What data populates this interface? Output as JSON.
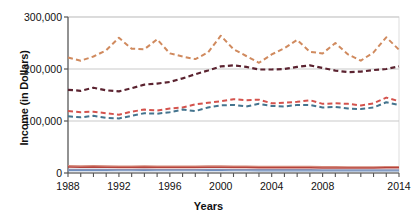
{
  "chart_data": {
    "type": "line",
    "title": "",
    "subtitle": "",
    "xlabel": "Years",
    "ylabel": "Income (in Dollars)",
    "xlim": [
      1988,
      2014
    ],
    "ylim": [
      0,
      300000
    ],
    "grid": true,
    "grid_axis": "y",
    "legend": "none",
    "y_ticks": [
      0,
      100000,
      200000,
      300000
    ],
    "y_tick_labels": [
      "0",
      "100,000",
      "200,000",
      "300,000"
    ],
    "x_ticks": [
      1988,
      1989,
      1990,
      1991,
      1992,
      1993,
      1994,
      1995,
      1996,
      1997,
      1998,
      1999,
      2000,
      2001,
      2002,
      2003,
      2004,
      2005,
      2006,
      2007,
      2008,
      2009,
      2010,
      2011,
      2012,
      2013,
      2014
    ],
    "x_tick_labels_shown": [
      "1988",
      "1992",
      "1996",
      "2000",
      "2004",
      "2008",
      "2014"
    ],
    "x_tick_labels_years": [
      1988,
      1992,
      1996,
      2000,
      2004,
      2008,
      2014
    ],
    "x": [
      1988,
      1989,
      1990,
      1991,
      1992,
      1993,
      1994,
      1995,
      1996,
      1997,
      1998,
      1999,
      2000,
      2001,
      2002,
      2003,
      2004,
      2005,
      2006,
      2007,
      2008,
      2009,
      2010,
      2011,
      2012,
      2013,
      2014
    ],
    "series": [
      {
        "name": "top-fifth-income",
        "color": "#d08a5e",
        "style": "dashed",
        "width": 2.0,
        "values": [
          222000,
          216000,
          224000,
          236000,
          260000,
          239000,
          238000,
          257000,
          230000,
          224000,
          219000,
          232000,
          264000,
          238000,
          225000,
          212000,
          228000,
          240000,
          256000,
          233000,
          230000,
          250000,
          228000,
          216000,
          232000,
          261000,
          237000
        ]
      },
      {
        "name": "fourth-fifth-income",
        "color": "#5b2330",
        "style": "dashed",
        "width": 2.2,
        "values": [
          160000,
          158000,
          164000,
          159000,
          157000,
          163000,
          170000,
          172000,
          175000,
          182000,
          190000,
          197000,
          205000,
          207000,
          204000,
          199000,
          199000,
          200000,
          204000,
          207000,
          202000,
          197000,
          194000,
          195000,
          198000,
          200000,
          205000
        ]
      },
      {
        "name": "third-fifth-income",
        "color": "#d4534d",
        "style": "dashed",
        "width": 2.0,
        "values": [
          119000,
          117000,
          118000,
          115000,
          112000,
          118000,
          122000,
          120000,
          124000,
          126000,
          132000,
          135000,
          138000,
          142000,
          140000,
          141000,
          134000,
          135000,
          137000,
          140000,
          133000,
          134000,
          133000,
          130000,
          134000,
          145000,
          138000
        ]
      },
      {
        "name": "second-fifth-income",
        "color": "#44748e",
        "style": "dashed",
        "width": 2.0,
        "values": [
          109000,
          107000,
          110000,
          106000,
          105000,
          110000,
          115000,
          114000,
          117000,
          122000,
          119000,
          126000,
          130000,
          131000,
          128000,
          133000,
          129000,
          128000,
          131000,
          131000,
          126000,
          127000,
          124000,
          123000,
          126000,
          136000,
          131000
        ]
      },
      {
        "name": "lowest-fifth-income-upper",
        "color": "#d4897a",
        "style": "solid",
        "width": 1.6,
        "values": [
          14000,
          13500,
          14000,
          13500,
          13000,
          13000,
          13500,
          13000,
          13000,
          13000,
          13000,
          13500,
          13500,
          13000,
          13000,
          12500,
          12500,
          12500,
          12500,
          12500,
          12000,
          12000,
          11500,
          11500,
          11500,
          12000,
          12000
        ]
      },
      {
        "name": "lowest-fifth-income-mid",
        "color": "#b5413a",
        "style": "solid",
        "width": 1.4,
        "values": [
          11500,
          11000,
          11500,
          11000,
          10500,
          10500,
          11000,
          10500,
          10500,
          10500,
          10500,
          11000,
          11000,
          10500,
          10500,
          10000,
          10000,
          10000,
          10000,
          10000,
          9500,
          9500,
          9500,
          9500,
          9500,
          10000,
          10000
        ]
      },
      {
        "name": "lowest-fifth-income-lower",
        "color": "#8a8fb0",
        "style": "solid",
        "width": 1.3,
        "values": [
          7000,
          6800,
          7000,
          6800,
          6500,
          6500,
          6800,
          6500,
          6500,
          6500,
          6500,
          6800,
          6800,
          6500,
          6500,
          6300,
          6300,
          6300,
          6300,
          6300,
          6000,
          6000,
          6000,
          6000,
          6000,
          6200,
          6200
        ]
      },
      {
        "name": "lowest-fifth-income-base",
        "color": "#6f8fc0",
        "style": "solid",
        "width": 1.2,
        "values": [
          4500,
          4400,
          4500,
          4400,
          4300,
          4300,
          4400,
          4300,
          4300,
          4300,
          4300,
          4400,
          4400,
          4300,
          4300,
          4200,
          4200,
          4200,
          4200,
          4200,
          4000,
          4000,
          4000,
          4000,
          4000,
          4100,
          4100
        ]
      }
    ],
    "colors": {
      "grid": "#c9c9c9",
      "axis": "#555555",
      "text": "#111111",
      "plot_border": "#dddddd",
      "background": "#ffffff"
    }
  }
}
